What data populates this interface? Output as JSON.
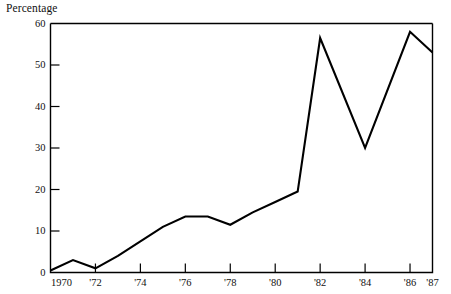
{
  "chart_data": {
    "type": "line",
    "title": "",
    "ylabel": "Percentage",
    "xlabel": "",
    "ylim": [
      0,
      60
    ],
    "yticks": [
      0,
      10,
      20,
      30,
      40,
      50,
      60
    ],
    "ytick_labels": [
      "0",
      "10",
      "20",
      "30",
      "40",
      "50",
      "60"
    ],
    "xlim": [
      1970,
      1987
    ],
    "xticks": [
      1970,
      1972,
      1974,
      1976,
      1978,
      1980,
      1982,
      1984,
      1986,
      1987
    ],
    "xtick_labels": [
      "1970",
      "'72",
      "'74",
      "'76",
      "'78",
      "'80",
      "'82",
      "'84",
      "'86",
      "'87"
    ],
    "xticks_with_marks": [
      1970,
      1972,
      1974,
      1976,
      1978,
      1980,
      1982,
      1984,
      1986
    ],
    "grid": false,
    "legend": null,
    "x": [
      1970,
      1971,
      1972,
      1973,
      1974,
      1975,
      1976,
      1977,
      1978,
      1979,
      1980,
      1981,
      1982,
      1984,
      1986,
      1987
    ],
    "values": [
      0.5,
      3,
      1,
      4,
      7.5,
      11,
      13.5,
      13.5,
      11.5,
      14.5,
      17,
      19.5,
      56.5,
      30,
      58,
      53
    ],
    "series": [
      {
        "name": "Percentage",
        "color": "#000000",
        "values": [
          0.5,
          3,
          1,
          4,
          7.5,
          11,
          13.5,
          13.5,
          11.5,
          14.5,
          17,
          19.5,
          56.5,
          30,
          58,
          53
        ]
      }
    ],
    "line_color": "#000000",
    "axis_color": "#000000",
    "background_color": "#ffffff"
  }
}
